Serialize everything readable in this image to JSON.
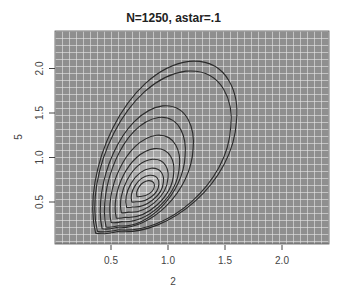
{
  "chart_data": {
    "type": "contour",
    "title": "N=1250, astar=.1",
    "xlabel": "2",
    "ylabel": "5",
    "xlim": [
      0.0,
      2.4
    ],
    "ylim": [
      0.0,
      2.4
    ],
    "x_ticks": [
      0.5,
      1.0,
      1.5,
      2.0
    ],
    "x_tick_labels": [
      "0.5",
      "1.0",
      "1.5",
      "2.0"
    ],
    "y_ticks": [
      0.5,
      1.0,
      1.5,
      2.0
    ],
    "y_tick_labels": [
      "0.5",
      "1.0",
      "1.5",
      "2.0"
    ],
    "grid": true,
    "background": "gray image with white grid",
    "mode": [
      0.8,
      0.65
    ],
    "contours": [
      {
        "level": 1,
        "x_range": [
          0.3,
          1.6
        ],
        "y_range": [
          0.15,
          2.08
        ]
      },
      {
        "level": 2,
        "x_range": [
          0.32,
          1.55
        ],
        "y_range": [
          0.17,
          1.97
        ]
      },
      {
        "level": 3,
        "x_range": [
          0.38,
          1.22
        ],
        "y_range": [
          0.2,
          1.58
        ]
      },
      {
        "level": 4,
        "x_range": [
          0.42,
          1.15
        ],
        "y_range": [
          0.22,
          1.45
        ]
      },
      {
        "level": 5,
        "x_range": [
          0.47,
          1.1
        ],
        "y_range": [
          0.27,
          1.25
        ]
      },
      {
        "level": 6,
        "x_range": [
          0.52,
          1.05
        ],
        "y_range": [
          0.32,
          1.1
        ]
      },
      {
        "level": 7,
        "x_range": [
          0.57,
          1.0
        ],
        "y_range": [
          0.38,
          0.98
        ]
      },
      {
        "level": 8,
        "x_range": [
          0.62,
          0.96
        ],
        "y_range": [
          0.44,
          0.88
        ]
      },
      {
        "level": 9,
        "x_range": [
          0.67,
          0.92
        ],
        "y_range": [
          0.5,
          0.8
        ]
      },
      {
        "level": 10,
        "x_range": [
          0.72,
          0.88
        ],
        "y_range": [
          0.56,
          0.74
        ]
      }
    ]
  }
}
